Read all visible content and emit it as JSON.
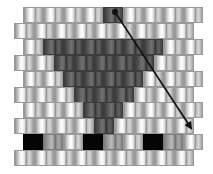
{
  "diagram": {
    "type": "brick-stitch-bead-pattern",
    "bead": {
      "width": 20,
      "height": 16
    },
    "grid_origin": {
      "top": 5
    },
    "row_offsets": {
      "odd": 23,
      "even": 14
    },
    "colors": {
      "light": "#f4f4f4",
      "dark": "#555555",
      "black": "#050505",
      "mid": "#a0a0a0",
      "arrow": "#111111"
    },
    "rows": [
      {
        "offset": "odd",
        "beads": [
          "light",
          "light",
          "light",
          "light",
          "dark",
          "light",
          "light",
          "light",
          "light"
        ]
      },
      {
        "offset": "even",
        "beads": [
          "light",
          "light",
          "light",
          "light",
          "light",
          "light",
          "light",
          "light",
          "light"
        ]
      },
      {
        "offset": "odd",
        "beads": [
          "light",
          "dark",
          "dark",
          "dark",
          "dark",
          "dark",
          "dark",
          "light",
          "light"
        ]
      },
      {
        "offset": "even",
        "beads": [
          "light",
          "light",
          "dark",
          "dark",
          "dark",
          "dark",
          "dark",
          "light",
          "light"
        ]
      },
      {
        "offset": "odd",
        "beads": [
          "light",
          "light",
          "dark",
          "dark",
          "dark",
          "dark",
          "light",
          "light",
          "light"
        ]
      },
      {
        "offset": "even",
        "beads": [
          "light",
          "light",
          "light",
          "dark",
          "dark",
          "dark",
          "light",
          "light",
          "light"
        ]
      },
      {
        "offset": "odd",
        "beads": [
          "light",
          "light",
          "light",
          "dark",
          "dark",
          "light",
          "light",
          "light",
          "light"
        ]
      },
      {
        "offset": "even",
        "beads": [
          "light",
          "light",
          "light",
          "light",
          "dark",
          "light",
          "light",
          "light",
          "light"
        ]
      },
      {
        "offset": "odd",
        "beads": [
          "black",
          "mid",
          "light",
          "black",
          "mid",
          "light",
          "black",
          "mid",
          "light"
        ]
      },
      {
        "offset": "even",
        "beads": [
          "light",
          "light",
          "light",
          "light",
          "light",
          "light",
          "light",
          "light",
          "light"
        ]
      }
    ],
    "arrow": {
      "start": {
        "x": 115,
        "y": 12
      },
      "end": {
        "x": 191,
        "y": 128
      },
      "start_marker": "dot",
      "end_marker": "arrowhead"
    }
  }
}
